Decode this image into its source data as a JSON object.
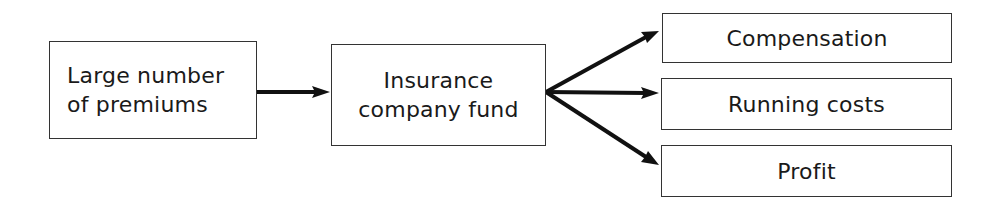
{
  "diagram": {
    "type": "flow",
    "nodes": {
      "source": "Large number\nof premiums",
      "fund": "Insurance\ncompany fund",
      "outputs": [
        "Compensation",
        "Running costs",
        "Profit"
      ]
    },
    "edges": [
      {
        "from": "Large number of premiums",
        "to": "Insurance company fund"
      },
      {
        "from": "Insurance company fund",
        "to": "Compensation"
      },
      {
        "from": "Insurance company fund",
        "to": "Running costs"
      },
      {
        "from": "Insurance company fund",
        "to": "Profit"
      }
    ],
    "colors": {
      "line": "#111111",
      "border": "#333333",
      "background": "#ffffff"
    }
  }
}
